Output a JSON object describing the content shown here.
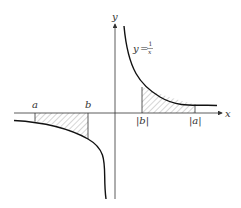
{
  "diagram": {
    "function_label": {
      "lhs": "y",
      "eq": "=",
      "num": "1",
      "den": "x"
    },
    "axes": {
      "x_label": "x",
      "y_label": "y"
    },
    "points": {
      "a": "a",
      "b": "b",
      "abs_b": "|b|",
      "abs_a": "|a|"
    },
    "colors": {
      "curve": "#111111",
      "axis": "#333333",
      "hatch": "#888888"
    }
  }
}
